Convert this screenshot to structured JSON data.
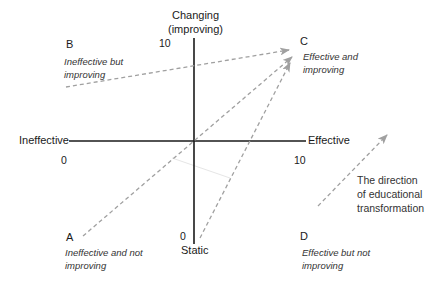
{
  "axes": {
    "y_top_label_line1": "Changing",
    "y_top_label_line2": "(improving)",
    "y_bottom_label": "Static",
    "x_left_label": "Ineffective",
    "x_right_label": "Effective",
    "y_max_tick": "10",
    "y_min_tick": "0",
    "x_min_tick": "0",
    "x_max_tick": "10"
  },
  "quadrants": [
    {
      "letter": "A",
      "desc_line1": "Ineffective and not",
      "desc_line2": "improving"
    },
    {
      "letter": "B",
      "desc_line1": "Ineffective but",
      "desc_line2": "improving"
    },
    {
      "letter": "C",
      "desc_line1": "Effective and",
      "desc_line2": "improving"
    },
    {
      "letter": "D",
      "desc_line1": "Effective but not",
      "desc_line2": "improving"
    }
  ],
  "legend": {
    "line1": "The direction",
    "line2": "of educational",
    "line3": "transformation"
  },
  "colors": {
    "axis": "#1a1a1a",
    "arrow": "#a0a0a0",
    "faint_line": "#e6e6e6"
  }
}
